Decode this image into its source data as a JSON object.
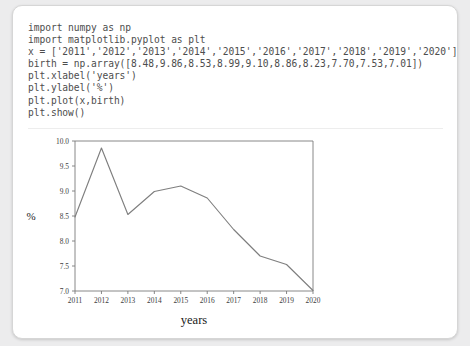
{
  "card": {
    "background_color": "#ffffff",
    "border_color": "#d6d6d6",
    "page_background": "#ececed"
  },
  "code": {
    "language": "python",
    "lines": [
      "import numpy as np",
      "import matplotlib.pyplot as plt",
      "x = ['2011','2012','2013','2014','2015','2016','2017','2018','2019','2020']",
      "birth = np.array([8.48,9.86,8.53,8.99,9.10,8.86,8.23,7.70,7.53,7.01])",
      "plt.xlabel('years')",
      "plt.ylabel('%')",
      "plt.plot(x,birth)",
      "plt.show()"
    ],
    "text_color": "#4d4d4d"
  },
  "chart_data": {
    "type": "line",
    "title": "",
    "xlabel": "years",
    "ylabel": "%",
    "categories": [
      "2011",
      "2012",
      "2013",
      "2014",
      "2015",
      "2016",
      "2017",
      "2018",
      "2019",
      "2020"
    ],
    "values": [
      8.48,
      9.86,
      8.53,
      8.99,
      9.1,
      8.86,
      8.23,
      7.7,
      7.53,
      7.01
    ],
    "series": [
      {
        "name": "birth",
        "values": [
          8.48,
          9.86,
          8.53,
          8.99,
          9.1,
          8.86,
          8.23,
          7.7,
          7.53,
          7.01
        ]
      }
    ],
    "ylim": [
      7.0,
      10.0
    ],
    "yticks": [
      "10.0",
      "9.5",
      "9.0",
      "8.5",
      "8.0",
      "7.5",
      "7.0"
    ],
    "ytick_values": [
      10.0,
      9.5,
      9.0,
      8.5,
      8.0,
      7.5,
      7.0
    ],
    "xticks": [
      "2011",
      "2012",
      "2013",
      "2014",
      "2015",
      "2016",
      "2017",
      "2018",
      "2019",
      "2020"
    ],
    "grid": false,
    "legend": "none",
    "line_color": "#7f7f7f",
    "axis_color": "#7a7a7a"
  }
}
